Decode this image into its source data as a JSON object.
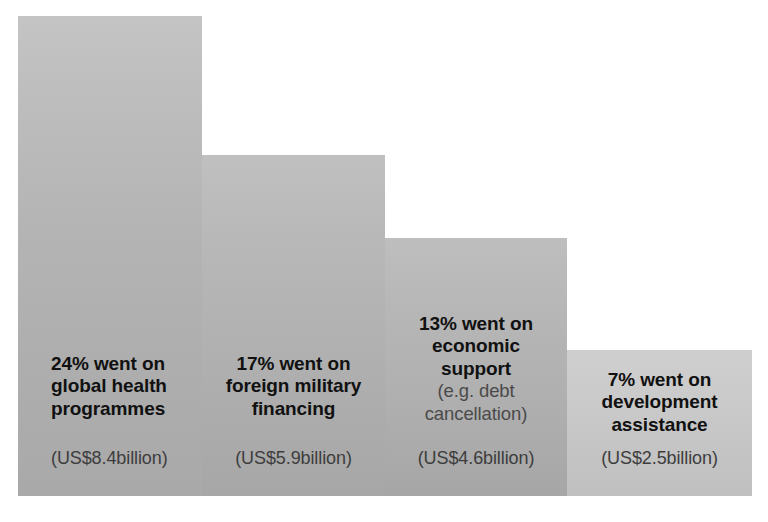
{
  "chart_data": {
    "type": "bar",
    "title": "",
    "subtitle": "",
    "xlabel": "",
    "ylabel": "",
    "grid": false,
    "legend": "none",
    "orientation": "vertical-descending",
    "value_unit": "percent of total",
    "categories": [
      "global health programmes",
      "foreign military financing",
      "economic support (e.g. debt cancellation)",
      "development assistance"
    ],
    "values": [
      24,
      17,
      13,
      7
    ],
    "value_labels": [
      "24%",
      "17%",
      "13%",
      "7%"
    ],
    "amounts_usd_billion": [
      8.4,
      5.9,
      4.6,
      2.5
    ],
    "amount_labels": [
      "(US$8.4billion)",
      "(US$5.9billion)",
      "(US$4.6billion)",
      "(US$2.5billion)"
    ],
    "ylim": [
      0,
      24
    ],
    "colors": {
      "bar_1": "#b4b4b4",
      "bar_2": "#b1b1b1",
      "bar_3": "#b0b0b0",
      "bar_4": "#c6c6c6",
      "background": "#ffffff",
      "headline_text": "#111111",
      "secondary_text": "#4a4a4a"
    }
  },
  "bars": [
    {
      "headline_lines": [
        "24% went on",
        "global health",
        "programmes"
      ],
      "subnote_lines": [],
      "amount": "(US$8.4billion)"
    },
    {
      "headline_lines": [
        "17% went on",
        "foreign military",
        "financing"
      ],
      "subnote_lines": [],
      "amount": "(US$5.9billion)"
    },
    {
      "headline_lines": [
        "13% went on",
        "economic support"
      ],
      "subnote_lines": [
        "(e.g. debt",
        "cancellation)"
      ],
      "amount": "(US$4.6billion)"
    },
    {
      "headline_lines": [
        "7% went on",
        "development",
        "assistance"
      ],
      "subnote_lines": [],
      "amount": "(US$2.5billion)"
    }
  ]
}
